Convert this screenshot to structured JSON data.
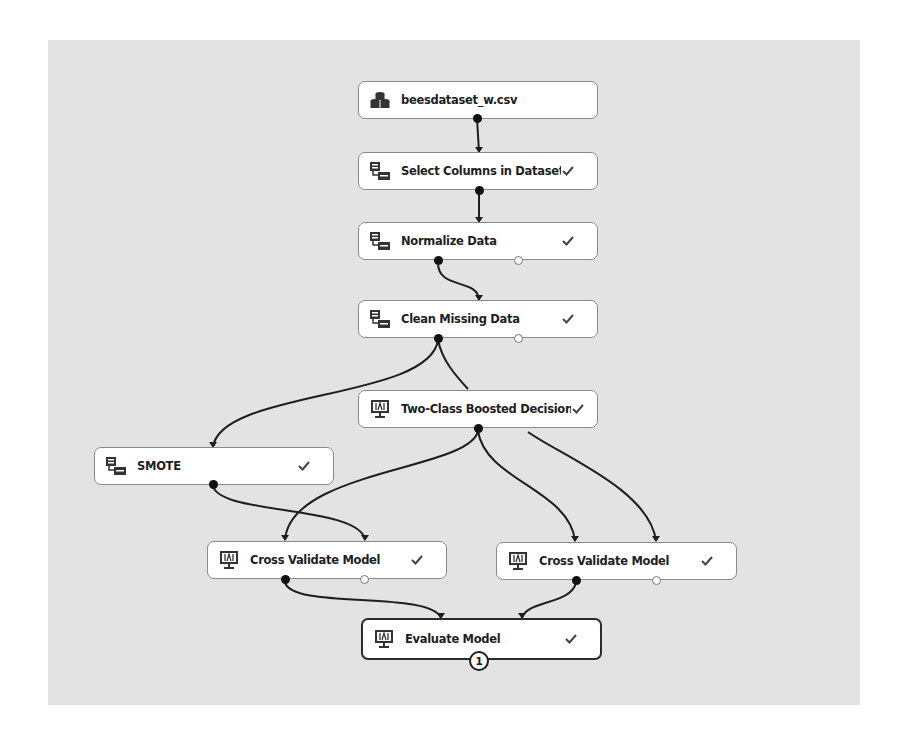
{
  "diagram": {
    "nodes": [
      {
        "id": "dataset",
        "label": "beesdataset_w.csv",
        "icon": "database-icon",
        "status": ""
      },
      {
        "id": "select",
        "label": "Select Columns in Dataset",
        "icon": "data-transform-icon",
        "status": "✓"
      },
      {
        "id": "normalize",
        "label": "Normalize Data",
        "icon": "data-transform-icon",
        "status": "✓"
      },
      {
        "id": "clean",
        "label": "Clean Missing Data",
        "icon": "data-transform-icon",
        "status": "✓"
      },
      {
        "id": "boosted",
        "label": "Two-Class Boosted Decision...",
        "icon": "model-monitor-icon",
        "status": "✓"
      },
      {
        "id": "smote",
        "label": "SMOTE",
        "icon": "data-transform-icon",
        "status": "✓"
      },
      {
        "id": "cv1",
        "label": "Cross Validate Model",
        "icon": "model-monitor-icon",
        "status": "✓"
      },
      {
        "id": "cv2",
        "label": "Cross Validate Model",
        "icon": "model-monitor-icon",
        "status": "✓"
      },
      {
        "id": "evaluate",
        "label": "Evaluate Model",
        "icon": "model-monitor-icon",
        "status": "✓",
        "badge": "1",
        "selected": true
      }
    ],
    "edges": [
      {
        "from": "dataset",
        "to": "select"
      },
      {
        "from": "select",
        "to": "normalize"
      },
      {
        "from": "normalize",
        "to": "clean"
      },
      {
        "from": "clean",
        "to": "smote"
      },
      {
        "from": "clean",
        "to": "boosted"
      },
      {
        "from": "boosted",
        "to": "cv1"
      },
      {
        "from": "smote",
        "to": "cv1"
      },
      {
        "from": "boosted",
        "to": "cv2"
      },
      {
        "from": "boosted",
        "to": "cv2"
      },
      {
        "from": "cv1",
        "to": "evaluate"
      },
      {
        "from": "cv2",
        "to": "evaluate"
      }
    ],
    "colors": {
      "canvas": "#e3e3e3",
      "node_bg": "#ffffff",
      "edge": "#1e1e1e",
      "node_border": "#8a8a8a"
    }
  }
}
